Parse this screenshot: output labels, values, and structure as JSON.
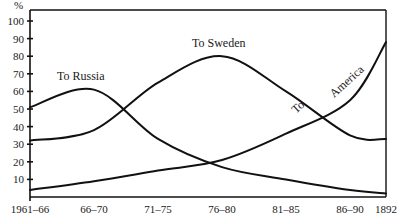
{
  "chart_data": {
    "type": "line",
    "title": "",
    "xlabel": "",
    "ylabel": "%",
    "ylim": [
      0,
      105
    ],
    "grid": false,
    "legend": "inline labels",
    "categories": [
      "1961–66",
      "66–70",
      "71–75",
      "76–80",
      "81–85",
      "86–90",
      "1892"
    ],
    "yticks": [
      10,
      20,
      30,
      40,
      50,
      60,
      70,
      80,
      90,
      100
    ],
    "series": [
      {
        "name": "To Russia",
        "values": [
          51,
          61,
          33,
          17,
          10,
          4,
          2
        ]
      },
      {
        "name": "To Sweden",
        "values": [
          32,
          38,
          65,
          80,
          60,
          35,
          33
        ]
      },
      {
        "name": "To America",
        "values": [
          4,
          9,
          15,
          21,
          36,
          55,
          88
        ]
      }
    ],
    "annotations": [
      {
        "text": "To Russia",
        "series": "To Russia"
      },
      {
        "text": "To Sweden",
        "series": "To Sweden"
      },
      {
        "text": "To",
        "series": "To America"
      },
      {
        "text": "America",
        "series": "To America"
      }
    ]
  }
}
